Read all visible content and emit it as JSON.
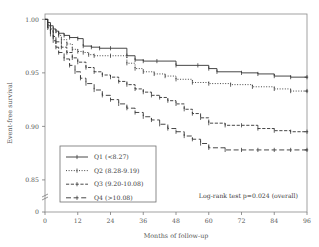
{
  "chart_data": {
    "type": "line",
    "title": "",
    "subtitle": "",
    "xlabel": "Months of follow-up",
    "ylabel": "Event-free survival",
    "xlim": [
      0,
      96
    ],
    "ylim": [
      0.82,
      1.005
    ],
    "grid": false,
    "axis_break": true,
    "xticks": [
      "0",
      "12",
      "24",
      "36",
      "48",
      "60",
      "72",
      "84",
      "96"
    ],
    "xtick_values": [
      0,
      12,
      24,
      36,
      48,
      60,
      72,
      84,
      96
    ],
    "yticks": [
      "0",
      "0.85",
      "0.90",
      "0.95",
      "1.00"
    ],
    "ytick_values": [
      0.82,
      0.85,
      0.9,
      0.95,
      1.0
    ],
    "legend_position": "lower-left",
    "annotation": "Log-rank test p=0.024 (overall)",
    "series": [
      {
        "name": "Q1 (<8.27)",
        "linestyle": "solid",
        "color": "#333333",
        "x": [
          0,
          1,
          2,
          3,
          4,
          5,
          7,
          9,
          12,
          14,
          17,
          20,
          24,
          30,
          33,
          36,
          41,
          48,
          56,
          60,
          63,
          72,
          78,
          84,
          90,
          96
        ],
        "y": [
          1.0,
          0.997,
          0.994,
          0.991,
          0.989,
          0.987,
          0.985,
          0.983,
          0.982,
          0.975,
          0.974,
          0.973,
          0.973,
          0.966,
          0.962,
          0.961,
          0.961,
          0.957,
          0.957,
          0.954,
          0.951,
          0.95,
          0.949,
          0.947,
          0.946,
          0.946
        ]
      },
      {
        "name": "Q2 (8.28-9.19)",
        "linestyle": "dotted",
        "color": "#333333",
        "x": [
          0,
          1,
          2,
          3,
          5,
          6,
          8,
          10,
          12,
          14,
          16,
          18,
          24,
          30,
          33,
          36,
          40,
          44,
          48,
          54,
          60,
          68,
          76,
          84,
          90,
          96
        ],
        "y": [
          1.0,
          0.995,
          0.991,
          0.988,
          0.985,
          0.981,
          0.977,
          0.972,
          0.97,
          0.969,
          0.967,
          0.966,
          0.966,
          0.959,
          0.954,
          0.951,
          0.949,
          0.947,
          0.944,
          0.941,
          0.94,
          0.939,
          0.937,
          0.935,
          0.933,
          0.933
        ]
      },
      {
        "name": "Q3 (9.20-10.08)",
        "linestyle": "dashdot",
        "color": "#333333",
        "x": [
          0,
          1,
          2,
          3,
          4,
          6,
          8,
          10,
          12,
          15,
          18,
          21,
          24,
          27,
          30,
          33,
          36,
          39,
          42,
          45,
          48,
          51,
          54,
          57,
          60,
          66,
          72,
          78,
          84,
          90,
          96
        ],
        "y": [
          1.0,
          0.994,
          0.989,
          0.984,
          0.979,
          0.974,
          0.969,
          0.964,
          0.96,
          0.955,
          0.951,
          0.948,
          0.946,
          0.942,
          0.939,
          0.935,
          0.932,
          0.929,
          0.927,
          0.924,
          0.921,
          0.916,
          0.912,
          0.908,
          0.903,
          0.901,
          0.901,
          0.898,
          0.896,
          0.895,
          0.895
        ]
      },
      {
        "name": "Q4 (>10.08)",
        "linestyle": "dashed",
        "color": "#333333",
        "x": [
          0,
          1,
          2,
          3,
          4,
          5,
          7,
          9,
          11,
          13,
          15,
          18,
          21,
          24,
          27,
          30,
          33,
          36,
          39,
          42,
          45,
          48,
          51,
          54,
          57,
          60,
          66,
          72,
          78,
          84,
          90,
          96
        ],
        "y": [
          1.0,
          0.992,
          0.986,
          0.98,
          0.974,
          0.969,
          0.963,
          0.957,
          0.951,
          0.945,
          0.94,
          0.934,
          0.929,
          0.925,
          0.921,
          0.917,
          0.913,
          0.909,
          0.906,
          0.902,
          0.898,
          0.895,
          0.891,
          0.888,
          0.884,
          0.88,
          0.878,
          0.878,
          0.878,
          0.878,
          0.878,
          0.878
        ]
      }
    ]
  },
  "figure": {
    "frame_color": "#8a8a8a",
    "background": "#ffffff"
  }
}
